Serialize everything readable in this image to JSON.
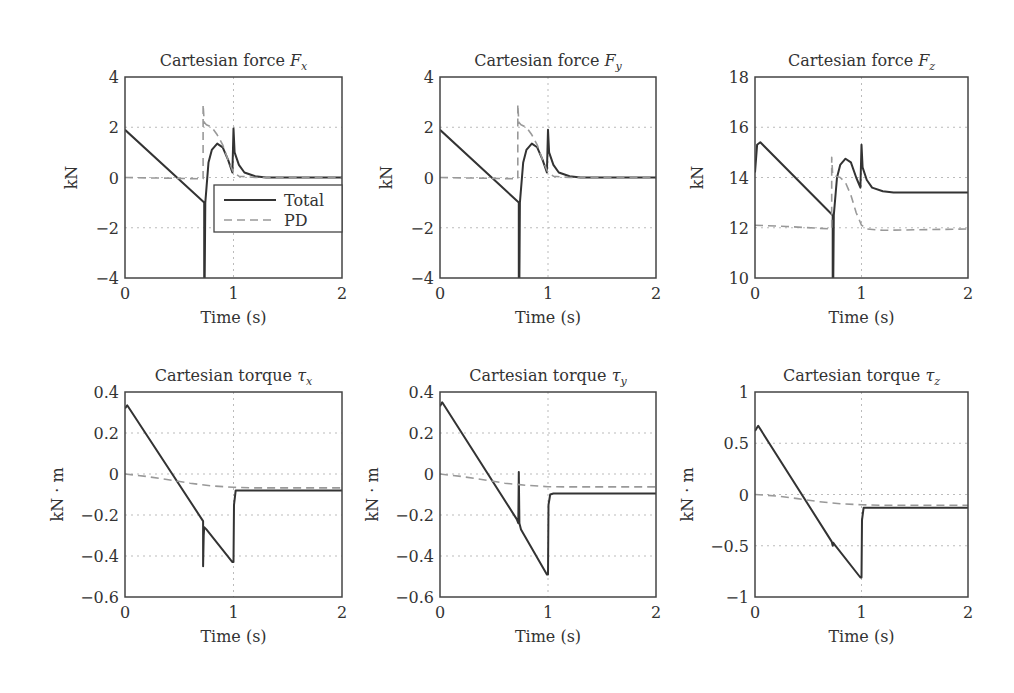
{
  "figure": {
    "legend": {
      "total_label": "Total",
      "pd_label": "PD"
    },
    "colors": {
      "total": "#333333",
      "pd": "#999999",
      "grid": "#bbbbbb",
      "axes": "#444444"
    }
  },
  "chart_data": [
    {
      "type": "line",
      "title": "Cartesian force F",
      "title_sub": "x",
      "xlabel": "Time (s)",
      "ylabel": "kN",
      "xlim": [
        0,
        2
      ],
      "ylim": [
        -4,
        4
      ],
      "xticks": [
        0,
        1,
        2
      ],
      "yticks": [
        -4,
        -2,
        0,
        2,
        4
      ],
      "grid": true,
      "legend": true,
      "series": [
        {
          "name": "Total",
          "x": [
            0,
            0.73,
            0.73,
            0.735,
            0.74,
            0.77,
            0.8,
            0.85,
            0.9,
            0.95,
            0.99,
            1.0,
            1.01,
            1.05,
            1.1,
            1.2,
            1.3,
            2.0
          ],
          "y": [
            1.9,
            -1.0,
            -4.0,
            -4.0,
            -1.0,
            0.6,
            1.1,
            1.35,
            1.2,
            0.7,
            0.2,
            1.95,
            1.0,
            0.5,
            0.2,
            0.05,
            0.0,
            0.0
          ]
        },
        {
          "name": "PD",
          "x": [
            0,
            0.72,
            0.72,
            0.73,
            0.75,
            0.8,
            0.85,
            0.9,
            0.95,
            1.0,
            1.05,
            1.2,
            2.0
          ],
          "y": [
            0.0,
            -0.05,
            2.9,
            2.2,
            2.1,
            2.0,
            1.7,
            1.3,
            0.7,
            0.2,
            0.05,
            0.0,
            0.0
          ]
        }
      ]
    },
    {
      "type": "line",
      "title": "Cartesian force F",
      "title_sub": "y",
      "xlabel": "Time (s)",
      "ylabel": "kN",
      "xlim": [
        0,
        2
      ],
      "ylim": [
        -4,
        4
      ],
      "xticks": [
        0,
        1,
        2
      ],
      "yticks": [
        -4,
        -2,
        0,
        2,
        4
      ],
      "grid": true,
      "legend": false,
      "series": [
        {
          "name": "Total",
          "x": [
            0,
            0.73,
            0.73,
            0.735,
            0.74,
            0.77,
            0.8,
            0.85,
            0.9,
            0.95,
            0.99,
            1.0,
            1.01,
            1.05,
            1.1,
            1.2,
            1.3,
            2.0
          ],
          "y": [
            1.9,
            -1.0,
            -4.0,
            -4.0,
            -1.0,
            0.6,
            1.1,
            1.35,
            1.2,
            0.7,
            0.2,
            1.9,
            1.0,
            0.5,
            0.2,
            0.05,
            0.0,
            0.0
          ]
        },
        {
          "name": "PD",
          "x": [
            0,
            0.72,
            0.72,
            0.73,
            0.75,
            0.8,
            0.85,
            0.9,
            0.95,
            1.0,
            1.05,
            1.2,
            2.0
          ],
          "y": [
            0.0,
            -0.05,
            2.9,
            2.2,
            2.1,
            2.0,
            1.7,
            1.3,
            0.7,
            0.2,
            0.05,
            0.0,
            0.0
          ]
        }
      ]
    },
    {
      "type": "line",
      "title": "Cartesian force F",
      "title_sub": "z",
      "xlabel": "Time (s)",
      "ylabel": "kN",
      "xlim": [
        0,
        2
      ],
      "ylim": [
        10,
        18
      ],
      "xticks": [
        0,
        1,
        2
      ],
      "yticks": [
        10,
        12,
        14,
        16,
        18
      ],
      "grid": true,
      "legend": false,
      "series": [
        {
          "name": "Total",
          "x": [
            0,
            0.02,
            0.05,
            0.73,
            0.73,
            0.735,
            0.74,
            0.77,
            0.8,
            0.85,
            0.9,
            0.95,
            0.99,
            1.0,
            1.01,
            1.05,
            1.1,
            1.2,
            1.3,
            2.0
          ],
          "y": [
            14.2,
            15.3,
            15.4,
            12.5,
            10.0,
            10.0,
            12.5,
            14.0,
            14.5,
            14.75,
            14.6,
            14.0,
            13.6,
            15.3,
            14.4,
            13.9,
            13.6,
            13.45,
            13.4,
            13.4
          ]
        },
        {
          "name": "PD",
          "x": [
            0,
            0.3,
            0.72,
            0.72,
            0.73,
            0.76,
            0.8,
            0.85,
            0.9,
            0.95,
            1.0,
            1.05,
            1.2,
            2.0
          ],
          "y": [
            12.1,
            12.05,
            11.95,
            14.8,
            14.1,
            14.05,
            14.0,
            13.8,
            13.3,
            12.6,
            12.1,
            11.95,
            11.9,
            11.95
          ]
        }
      ]
    },
    {
      "type": "line",
      "title": "Cartesian torque τ",
      "title_sub": "x",
      "xlabel": "Time (s)",
      "ylabel": "kN · m",
      "xlim": [
        0,
        2
      ],
      "ylim": [
        -0.6,
        0.4
      ],
      "xticks": [
        0,
        1,
        2
      ],
      "yticks": [
        -0.6,
        -0.4,
        -0.2,
        0,
        0.2,
        0.4
      ],
      "ytick_labels": [
        "−0.6",
        "−0.4",
        "−0.2",
        "0",
        "0.2",
        "0.4"
      ],
      "grid": true,
      "legend": false,
      "series": [
        {
          "name": "Total",
          "x": [
            0,
            0.02,
            0.72,
            0.72,
            0.725,
            0.73,
            0.75,
            0.99,
            1.0,
            1.005,
            1.02,
            2.0
          ],
          "y": [
            0.32,
            0.335,
            -0.23,
            -0.45,
            -0.3,
            -0.26,
            -0.27,
            -0.43,
            -0.43,
            -0.15,
            -0.08,
            -0.08
          ]
        },
        {
          "name": "PD",
          "x": [
            0,
            0.2,
            0.4,
            0.6,
            0.8,
            1.0,
            1.2,
            2.0
          ],
          "y": [
            0.0,
            -0.012,
            -0.028,
            -0.045,
            -0.058,
            -0.065,
            -0.068,
            -0.068
          ]
        }
      ]
    },
    {
      "type": "line",
      "title": "Cartesian torque τ",
      "title_sub": "y",
      "xlabel": "Time (s)",
      "ylabel": "kN · m",
      "xlim": [
        0,
        2
      ],
      "ylim": [
        -0.6,
        0.4
      ],
      "xticks": [
        0,
        1,
        2
      ],
      "yticks": [
        -0.6,
        -0.4,
        -0.2,
        0,
        0.2,
        0.4
      ],
      "ytick_labels": [
        "−0.6",
        "−0.4",
        "−0.2",
        "0",
        "0.2",
        "0.4"
      ],
      "grid": true,
      "legend": false,
      "series": [
        {
          "name": "Total",
          "x": [
            0,
            0.02,
            0.71,
            0.725,
            0.73,
            0.735,
            0.75,
            0.99,
            1.0,
            1.005,
            1.02,
            1.05,
            2.0
          ],
          "y": [
            0.33,
            0.35,
            -0.22,
            -0.24,
            0.01,
            -0.24,
            -0.27,
            -0.49,
            -0.49,
            -0.15,
            -0.1,
            -0.095,
            -0.095
          ]
        },
        {
          "name": "PD",
          "x": [
            0,
            0.2,
            0.4,
            0.6,
            0.8,
            1.0,
            1.2,
            2.0
          ],
          "y": [
            0.0,
            -0.012,
            -0.028,
            -0.045,
            -0.055,
            -0.062,
            -0.063,
            -0.063
          ]
        }
      ]
    },
    {
      "type": "line",
      "title": "Cartesian torque τ",
      "title_sub": "z",
      "xlabel": "Time (s)",
      "ylabel": "kN · m",
      "xlim": [
        0,
        2
      ],
      "ylim": [
        -1,
        1
      ],
      "xticks": [
        0,
        1,
        2
      ],
      "yticks": [
        -1,
        -0.5,
        0,
        0.5,
        1
      ],
      "ytick_labels": [
        "−1",
        "−0.5",
        "0",
        "0.5",
        "1"
      ],
      "grid": true,
      "legend": false,
      "series": [
        {
          "name": "Total",
          "x": [
            0,
            0.03,
            0.72,
            0.73,
            0.735,
            0.74,
            0.99,
            1.0,
            1.005,
            1.02,
            2.0
          ],
          "y": [
            0.62,
            0.67,
            -0.46,
            -0.5,
            -0.47,
            -0.48,
            -0.81,
            -0.81,
            -0.25,
            -0.13,
            -0.13
          ]
        },
        {
          "name": "PD",
          "x": [
            0,
            0.2,
            0.4,
            0.6,
            0.8,
            1.0,
            1.2,
            2.0
          ],
          "y": [
            0.0,
            -0.015,
            -0.04,
            -0.07,
            -0.09,
            -0.1,
            -0.105,
            -0.105
          ]
        }
      ]
    }
  ]
}
